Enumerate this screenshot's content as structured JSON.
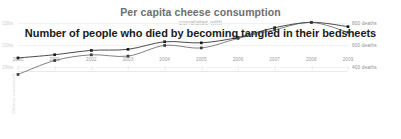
{
  "header": {
    "title_primary": "Per capita cheese consumption",
    "connector": "correlates with",
    "title_secondary": "Number of people who died by becoming tangled in their bedsheets"
  },
  "chart_data": {
    "type": "line",
    "title": "Per capita cheese consumption correlates with Number of people who died by becoming tangled in their bedsheets",
    "xlabel": "",
    "ylabel": "Bedsheet tanglings",
    "grid": true,
    "legend_position": "none",
    "categories": [
      "2000",
      "2001",
      "2002",
      "2003",
      "2004",
      "2005",
      "2006",
      "2007",
      "2008",
      "2009"
    ],
    "axis_left": {
      "title": "Cheese consumed",
      "unit": "lbs",
      "ticks": [
        "33lbs",
        "31lbs",
        "29lbs"
      ],
      "tick_values": [
        33,
        31,
        29
      ],
      "range": [
        28.5,
        33.5
      ]
    },
    "axis_right": {
      "title": "Bedsheet tanglings",
      "unit": "deaths",
      "ticks": [
        "800 deaths",
        "600 deaths",
        "400 deaths"
      ],
      "tick_values": [
        800,
        600,
        400
      ],
      "range": [
        350,
        850
      ]
    },
    "series": [
      {
        "name": "Per capita cheese consumption",
        "unit": "lbs",
        "axis": "left",
        "color": "#2b2b2b",
        "values": [
          29.8,
          30.1,
          30.5,
          30.6,
          31.3,
          31.2,
          31.7,
          32.6,
          33.1,
          32.7
        ]
      },
      {
        "name": "Number of people who died by becoming tangled in their bedsheets",
        "unit": "deaths",
        "axis": "right",
        "color": "#4a4a4a",
        "values": [
          327,
          456,
          509,
          497,
          596,
          573,
          661,
          741,
          809,
          717
        ]
      }
    ]
  }
}
